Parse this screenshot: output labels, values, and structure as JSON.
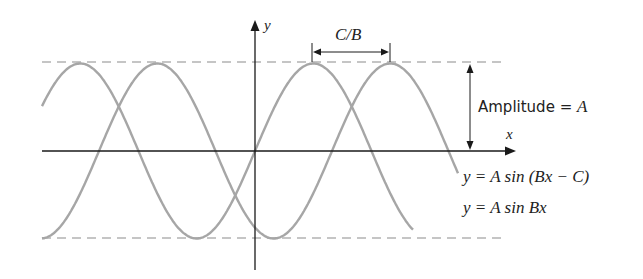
{
  "labels": {
    "y_axis": "y",
    "x_axis": "x",
    "phase_shift": "C/B",
    "amplitude_text": "Amplitude = ",
    "amplitude_var": "A",
    "curve_shifted": "y = A sin (Bx − C)",
    "curve_base": "y = A sin Bx"
  },
  "geometry": {
    "origin": [
      255,
      151
    ],
    "amplitude_px": 87.5,
    "period_px": 233,
    "phase_shift_px": 77,
    "x_range": [
      42,
      504
    ],
    "colors": {
      "axes": "#1a1a1a",
      "curves": "#a6a6a6",
      "dashed": "#b3b3b3",
      "text": "#222222"
    }
  }
}
